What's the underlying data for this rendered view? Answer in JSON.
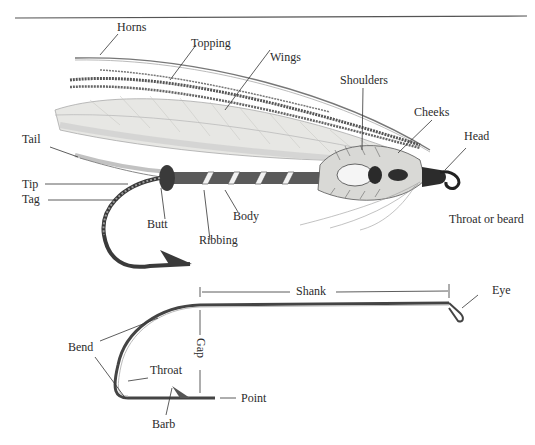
{
  "figure": {
    "fly_labels": {
      "horns": "Horns",
      "topping": "Topping",
      "wings": "Wings",
      "shoulders": "Shoulders",
      "cheeks": "Cheeks",
      "head": "Head",
      "tail": "Tail",
      "tip": "Tip",
      "tag": "Tag",
      "butt": "Butt",
      "ribbing": "Ribbing",
      "body": "Body",
      "throat_or_beard": "Throat or beard"
    },
    "hook_labels": {
      "shank": "Shank",
      "eye": "Eye",
      "bend": "Bend",
      "gap": "Gap",
      "throat": "Throat",
      "point": "Point",
      "barb": "Barb"
    },
    "colors": {
      "ink": "#2b2b2b",
      "rule": "#555555",
      "wing_fill": "#e6e6e3",
      "body_dark": "#3a3a3a"
    }
  }
}
